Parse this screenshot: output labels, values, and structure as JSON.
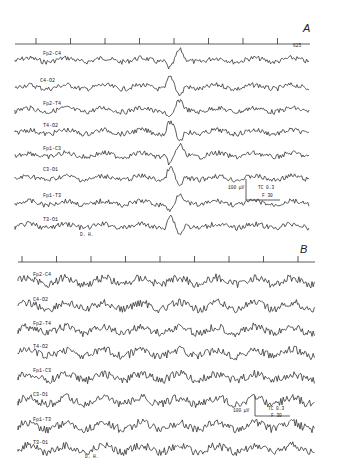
{
  "panels": [
    {
      "id": "A",
      "label": "A",
      "time_marker": "625",
      "channels": [
        "Fp2-C4",
        "C4-O2",
        "Fp2-T4",
        "T4-O2",
        "Fp1-C3",
        "C3-O1",
        "Fp1-T3",
        "T3-O1"
      ],
      "calibration": {
        "amplitude": "100 µV",
        "tc": "TC 0.3",
        "filter": "F 30",
        "time": "1 sec"
      },
      "subject": "D. H."
    },
    {
      "id": "B",
      "label": "B",
      "channels": [
        "Fp2-C4",
        "C4-O2",
        "Fp2-T4",
        "T4-O2",
        "Fp1-C3",
        "C3-O1",
        "Fp1-T3",
        "T3-O1"
      ],
      "calibration": {
        "amplitude": "100 µV",
        "tc": "TC 0.3",
        "filter": "F 30",
        "time": "1 sec"
      },
      "subject": "D. H."
    }
  ]
}
